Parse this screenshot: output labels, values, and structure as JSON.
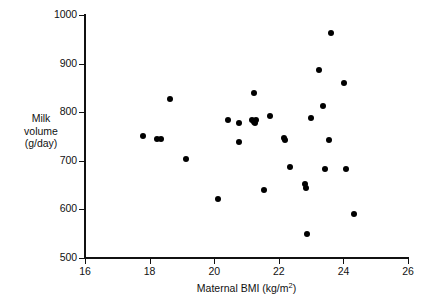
{
  "chart_data": {
    "type": "scatter",
    "title": "",
    "xlabel": "Maternal BMI (kg/m2)",
    "xlabel_base": "Maternal BMI (kg/m",
    "xlabel_exp": "2",
    "xlabel_tail": ")",
    "ylabel_lines": [
      "Milk",
      "volume",
      "(g/day)"
    ],
    "ylabel": "Milk volume (g/day)",
    "xlim": [
      16,
      26
    ],
    "ylim": [
      500,
      1000
    ],
    "xticks": [
      16,
      18,
      20,
      22,
      24,
      26
    ],
    "yticks": [
      500,
      600,
      700,
      800,
      900,
      1000
    ],
    "xtick_labels": [
      "16",
      "18",
      "20",
      "22",
      "24",
      "26"
    ],
    "ytick_labels": [
      "500",
      "600",
      "700",
      "800",
      "900",
      "1000"
    ],
    "grid": false,
    "legend": false,
    "marker": "filled-circle",
    "marker_color": "#000000",
    "n_points": 32,
    "x": [
      17.81,
      18.24,
      18.36,
      18.63,
      19.13,
      20.12,
      20.44,
      20.76,
      20.78,
      21.16,
      21.24,
      21.26,
      21.29,
      21.55,
      21.74,
      22.16,
      22.2,
      22.36,
      22.82,
      22.84,
      22.87,
      23.01,
      23.26,
      23.38,
      23.43,
      23.54,
      23.61,
      23.68,
      24.02,
      24.09,
      24.33,
      21.22
    ],
    "y": [
      751,
      744,
      744,
      827,
      703,
      622,
      784,
      777,
      739,
      783,
      780,
      778,
      784,
      640,
      793,
      747,
      742,
      688,
      653,
      644,
      550,
      789,
      886,
      812,
      683,
      742,
      963,
      683,
      860,
      683,
      590,
      840
    ],
    "points": [
      {
        "x": 17.81,
        "y": 751
      },
      {
        "x": 18.24,
        "y": 744
      },
      {
        "x": 18.36,
        "y": 744
      },
      {
        "x": 18.63,
        "y": 827
      },
      {
        "x": 19.13,
        "y": 703
      },
      {
        "x": 20.12,
        "y": 622
      },
      {
        "x": 20.44,
        "y": 784
      },
      {
        "x": 20.76,
        "y": 777
      },
      {
        "x": 20.78,
        "y": 739
      },
      {
        "x": 21.16,
        "y": 783
      },
      {
        "x": 21.24,
        "y": 780
      },
      {
        "x": 21.26,
        "y": 778
      },
      {
        "x": 21.29,
        "y": 784
      },
      {
        "x": 21.22,
        "y": 840
      },
      {
        "x": 21.55,
        "y": 640
      },
      {
        "x": 21.74,
        "y": 793
      },
      {
        "x": 22.16,
        "y": 747
      },
      {
        "x": 22.2,
        "y": 742
      },
      {
        "x": 22.36,
        "y": 688
      },
      {
        "x": 22.82,
        "y": 653
      },
      {
        "x": 22.84,
        "y": 644
      },
      {
        "x": 22.87,
        "y": 550
      },
      {
        "x": 23.01,
        "y": 789
      },
      {
        "x": 23.26,
        "y": 886
      },
      {
        "x": 23.38,
        "y": 812
      },
      {
        "x": 23.43,
        "y": 683
      },
      {
        "x": 23.54,
        "y": 742
      },
      {
        "x": 23.61,
        "y": 963
      },
      {
        "x": 24.02,
        "y": 860
      },
      {
        "x": 24.09,
        "y": 683
      },
      {
        "x": 24.33,
        "y": 590
      }
    ]
  }
}
